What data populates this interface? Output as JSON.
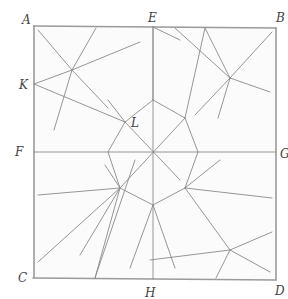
{
  "diagram": {
    "title": "",
    "stroke_color": "#8a8a8a",
    "frame_color": "#9a9a9a",
    "paper_color": "#fbfbfb",
    "labels": [
      {
        "id": "A",
        "text": "A",
        "x": 22,
        "y": 14
      },
      {
        "id": "E",
        "text": "E",
        "x": 148,
        "y": 12
      },
      {
        "id": "B",
        "text": "B",
        "x": 276,
        "y": 12
      },
      {
        "id": "K",
        "text": "K",
        "x": 19,
        "y": 79
      },
      {
        "id": "L",
        "text": "L",
        "x": 131,
        "y": 117
      },
      {
        "id": "F",
        "text": "F",
        "x": 15,
        "y": 146
      },
      {
        "id": "G",
        "text": "G",
        "x": 280,
        "y": 148
      },
      {
        "id": "C",
        "text": "C",
        "x": 18,
        "y": 272
      },
      {
        "id": "H",
        "text": "H",
        "x": 145,
        "y": 287
      },
      {
        "id": "D",
        "text": "D",
        "x": 275,
        "y": 285
      }
    ],
    "frame": {
      "A": [
        34,
        26
      ],
      "B": [
        276,
        28
      ],
      "C": [
        33,
        278
      ],
      "D": [
        276,
        280
      ]
    },
    "segments": [
      [
        34,
        26,
        34,
        278
      ],
      [
        34,
        26,
        276,
        28
      ],
      [
        276,
        28,
        276,
        280
      ],
      [
        33,
        278,
        276,
        280
      ],
      [
        153,
        27,
        153,
        279
      ],
      [
        34,
        152,
        276,
        152
      ],
      [
        38,
        30,
        72,
        70
      ],
      [
        72,
        70,
        96,
        28
      ],
      [
        72,
        70,
        140,
        42
      ],
      [
        34,
        84,
        72,
        70
      ],
      [
        72,
        70,
        108,
        108
      ],
      [
        72,
        70,
        54,
        130
      ],
      [
        34,
        84,
        125,
        122
      ],
      [
        175,
        28,
        230,
        78
      ],
      [
        230,
        78,
        272,
        32
      ],
      [
        230,
        78,
        270,
        92
      ],
      [
        230,
        78,
        218,
        118
      ],
      [
        230,
        78,
        205,
        28
      ],
      [
        195,
        115,
        230,
        78
      ],
      [
        153,
        27,
        153,
        100
      ],
      [
        153,
        27,
        180,
        40
      ],
      [
        125,
        122,
        153,
        100
      ],
      [
        153,
        100,
        185,
        118
      ],
      [
        185,
        118,
        198,
        152
      ],
      [
        198,
        152,
        185,
        188
      ],
      [
        185,
        188,
        153,
        205
      ],
      [
        153,
        205,
        120,
        188
      ],
      [
        120,
        188,
        108,
        152
      ],
      [
        108,
        152,
        125,
        122
      ],
      [
        125,
        122,
        180,
        180
      ],
      [
        185,
        118,
        120,
        188
      ],
      [
        125,
        122,
        108,
        100
      ],
      [
        185,
        118,
        205,
        28
      ],
      [
        120,
        188,
        80,
        255
      ],
      [
        120,
        188,
        38,
        195
      ],
      [
        120,
        188,
        38,
        262
      ],
      [
        120,
        188,
        95,
        278
      ],
      [
        120,
        188,
        105,
        165
      ],
      [
        185,
        188,
        230,
        250
      ],
      [
        185,
        188,
        272,
        198
      ],
      [
        185,
        188,
        220,
        160
      ],
      [
        230,
        250,
        272,
        232
      ],
      [
        230,
        250,
        270,
        272
      ],
      [
        230,
        250,
        216,
        278
      ],
      [
        230,
        250,
        150,
        260
      ],
      [
        95,
        278,
        135,
        160
      ],
      [
        153,
        205,
        130,
        268
      ],
      [
        153,
        205,
        175,
        268
      ]
    ]
  }
}
